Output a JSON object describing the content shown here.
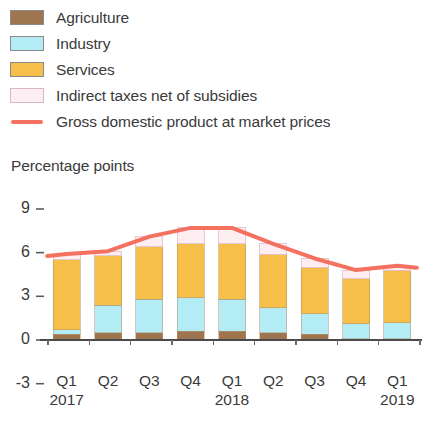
{
  "legend": {
    "items": [
      {
        "label": "Agriculture",
        "color": "#9d7650",
        "type": "swatch",
        "icon": "square-swatch-icon"
      },
      {
        "label": "Industry",
        "color": "#b3ecf4",
        "type": "swatch",
        "icon": "square-swatch-icon"
      },
      {
        "label": "Services",
        "color": "#f5bf4a",
        "type": "swatch",
        "icon": "square-swatch-icon"
      },
      {
        "label": "Indirect taxes net of subsidies",
        "color": "#fdeef2",
        "type": "swatch",
        "icon": "square-swatch-icon"
      },
      {
        "label": "Gross domestic product at market prices",
        "color": "#f4705f",
        "type": "line",
        "icon": "line-swatch-icon"
      }
    ]
  },
  "chart_data": {
    "type": "bar",
    "stacked": true,
    "title": "",
    "subtitle": "",
    "ylabel": "Percentage points",
    "xlabel": "",
    "ylim": [
      -3,
      9
    ],
    "yticks": [
      9,
      6,
      3,
      0,
      -3
    ],
    "ytick_labels": [
      "9",
      "6",
      "3",
      "0",
      "-3"
    ],
    "grid": false,
    "legend_position": "top-left",
    "categories": [
      "Q1",
      "Q2",
      "Q3",
      "Q4",
      "Q1",
      "Q2",
      "Q3",
      "Q4",
      "Q1"
    ],
    "group_labels": [
      {
        "label": "2017",
        "index": 0
      },
      {
        "label": "2018",
        "index": 4
      },
      {
        "label": "2019",
        "index": 8
      }
    ],
    "series": [
      {
        "name": "Agriculture",
        "color": "#9d7650",
        "values": [
          0.4,
          0.5,
          0.5,
          0.6,
          0.6,
          0.5,
          0.4,
          0.1,
          0.1
        ]
      },
      {
        "name": "Industry",
        "color": "#b3ecf4",
        "values": [
          0.3,
          1.9,
          2.3,
          2.3,
          2.2,
          1.7,
          1.4,
          1.0,
          1.1
        ]
      },
      {
        "name": "Services",
        "color": "#f5bf4a",
        "values": [
          4.8,
          3.4,
          3.6,
          3.7,
          3.8,
          3.7,
          3.2,
          3.1,
          3.6
        ]
      },
      {
        "name": "Indirect taxes net of subsidies",
        "color": "#fdeef2",
        "values": [
          0.4,
          0.3,
          0.7,
          1.1,
          1.1,
          0.7,
          0.6,
          0.6,
          0.3
        ]
      }
    ],
    "line_series": {
      "name": "Gross domestic product at market prices",
      "color": "#f4705f",
      "values": [
        5.9,
        6.1,
        7.1,
        7.7,
        7.7,
        6.6,
        5.6,
        4.8,
        5.1
      ]
    }
  }
}
